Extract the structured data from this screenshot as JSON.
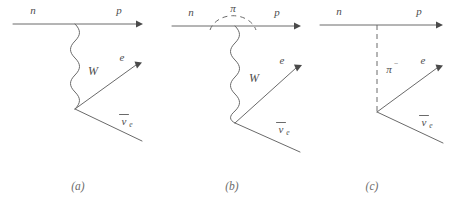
{
  "figure": {
    "background_color": "#ffffff",
    "line_color": "#6a6a6a",
    "label_color": "#4d4d4d",
    "caption_color": "#6b6b6b"
  },
  "diagrams": [
    {
      "caption": "(a)",
      "labels": {
        "incoming_nucleon": "n",
        "outgoing_nucleon": "p",
        "boson": "W",
        "lepton": "e",
        "antineutrino_symbol": "ν",
        "antineutrino_subscript": "e"
      },
      "propagator_type": "wavy"
    },
    {
      "caption": "(b)",
      "labels": {
        "incoming_nucleon": "n",
        "outgoing_nucleon": "p",
        "boson": "W",
        "pion_loop": "π",
        "lepton": "e",
        "antineutrino_symbol": "ν",
        "antineutrino_subscript": "e"
      },
      "propagator_type": "wavy-with-pion-loop"
    },
    {
      "caption": "(c)",
      "labels": {
        "incoming_nucleon": "n",
        "outgoing_nucleon": "p",
        "pion_symbol": "π",
        "pion_charge": "−",
        "lepton": "e",
        "antineutrino_symbol": "ν",
        "antineutrino_subscript": "e"
      },
      "propagator_type": "dashed"
    }
  ]
}
